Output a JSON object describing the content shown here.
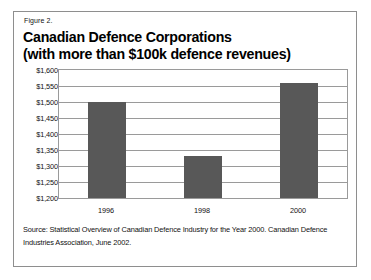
{
  "figure": {
    "number_label": "Figure 2.",
    "title_line1": "Canadian Defence Corporations",
    "title_line2": "(with more than $100k defence revenues)",
    "source": "Source: Statistical Overview of Canadian Defence Industry for the Year 2000. Canadian Defence Industries Association, June 2002."
  },
  "colors": {
    "bar_fill": "#585858",
    "grid": "#9a9a9a",
    "frame": "#8e8e8e",
    "text": "#111111",
    "background": "#ffffff"
  },
  "chart_data": {
    "type": "bar",
    "title": "Canadian Defence Corporations (with more than $100k defence revenues)",
    "subtitle": "Figure 2.",
    "categories": [
      "1996",
      "1998",
      "2000"
    ],
    "values": [
      1500,
      1330,
      1560
    ],
    "series": [
      {
        "name": "Number of Canadian defence corporations",
        "values": [
          1500,
          1330,
          1560
        ]
      }
    ],
    "xlabel": "",
    "ylabel": "",
    "ylim": [
      1200,
      1600
    ],
    "ytick_step": 50,
    "ytick_labels": [
      "$1,600",
      "$1,550",
      "$1,500",
      "$1,450",
      "$1,400",
      "$1,350",
      "$1,300",
      "$1,250",
      "$1,200"
    ],
    "ytick_values": [
      1600,
      1550,
      1500,
      1450,
      1400,
      1350,
      1300,
      1250,
      1200
    ],
    "grid": true,
    "grid_axis": "y",
    "legend": false,
    "legend_position": "none",
    "annotations": [],
    "source": "Source: Statistical Overview of Canadian Defence Industry for the Year 2000. Canadian Defence Industries Association, June 2002."
  }
}
